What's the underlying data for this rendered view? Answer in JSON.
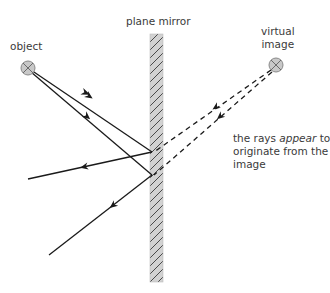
{
  "diagram": {
    "labels": {
      "mirror": "plane mirror",
      "object": "object",
      "virtual_image_line1": "virtual",
      "virtual_image_line2": "image",
      "note_line1_pre": "the rays ",
      "note_line1_em": "appear",
      "note_line1_post": " to",
      "note_line2": "originate from the",
      "note_line3": "image"
    },
    "elements": {
      "object": {
        "x": 28,
        "y": 68,
        "symbol": "circled-x",
        "fill": "#c8c8c8"
      },
      "virtual_image": {
        "x": 275,
        "y": 68,
        "symbol": "circled-x",
        "fill": "#c8c8c8"
      },
      "mirror": {
        "x": 150,
        "y": 34,
        "width": 13,
        "height": 248,
        "fill": "#d0d0d0",
        "hatch": "#444444"
      },
      "reflection_points": [
        {
          "x": 152,
          "y": 152
        },
        {
          "x": 152,
          "y": 175
        }
      ],
      "incident_rays": [
        {
          "from": [
            28,
            68
          ],
          "to": [
            152,
            152
          ]
        },
        {
          "from": [
            28,
            68
          ],
          "to": [
            152,
            175
          ]
        }
      ],
      "reflected_rays": [
        {
          "from": [
            152,
            152
          ],
          "to": [
            28,
            179
          ]
        },
        {
          "from": [
            152,
            175
          ],
          "to": [
            49,
            255
          ]
        }
      ],
      "virtual_rays_dashed": [
        {
          "from": [
            275,
            68
          ],
          "to": [
            152,
            152
          ]
        },
        {
          "from": [
            275,
            68
          ],
          "to": [
            152,
            175
          ]
        }
      ]
    },
    "colors": {
      "line": "#1a1a1a",
      "text": "#3a3a3a",
      "mirror_fill": "#d0d0d0",
      "symbol_fill": "#c8c8c8"
    }
  }
}
